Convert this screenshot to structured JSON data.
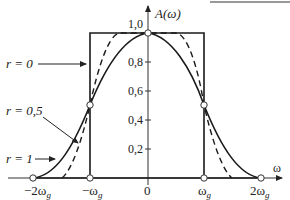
{
  "figure": {
    "y_axis_label": "A(ω)",
    "x_axis_label": "ω",
    "y_ticks": [
      "1,0",
      "0,8",
      "0,6",
      "0,4",
      "0,2"
    ],
    "x_ticks": [
      "−2ωg",
      "−ωg",
      "0",
      "ωg",
      "2ωg"
    ],
    "x_tick_parts": [
      {
        "main": "−2ω",
        "sub": "g"
      },
      {
        "main": "−ω",
        "sub": "g"
      },
      {
        "main": "0",
        "sub": ""
      },
      {
        "main": "ω",
        "sub": "g"
      },
      {
        "main": "2ω",
        "sub": "g"
      }
    ],
    "curve_labels": [
      {
        "text": "r = 0",
        "style": "solid rectangle"
      },
      {
        "text": "r = 0,5",
        "style": "dashed"
      },
      {
        "text": "r = 1",
        "style": "solid"
      }
    ],
    "colors": {
      "line": "#1a1a1a",
      "axis": "#333333",
      "marker_fill": "#ffffff"
    }
  }
}
